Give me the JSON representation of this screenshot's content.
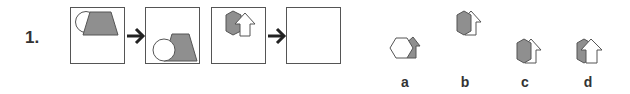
{
  "question": {
    "number": "1.",
    "sequence": [
      {
        "id": "frame-1",
        "content": "circle-left-of-gray-trapezoid-top"
      },
      {
        "id": "frame-2",
        "content": "circle-left-of-gray-trapezoid-bottom"
      },
      {
        "id": "frame-3",
        "content": "gray-hexagon-left-of-white-arrow-top"
      },
      {
        "id": "frame-4",
        "content": "empty-answer-slot"
      }
    ],
    "arrow_icon": "right-arrow-icon"
  },
  "options": [
    {
      "label": "a",
      "content": "white-hexagon-over-gray-arrow"
    },
    {
      "label": "b",
      "content": "gray-hexagon-over-white-arrow-top"
    },
    {
      "label": "c",
      "content": "gray-hexagon-over-white-arrow-bottom"
    },
    {
      "label": "d",
      "content": "white-arrow-over-gray-hexagon-bottom"
    }
  ],
  "colors": {
    "fill_gray": "#8f8f8f",
    "outline": "#555555",
    "text": "#333333"
  }
}
